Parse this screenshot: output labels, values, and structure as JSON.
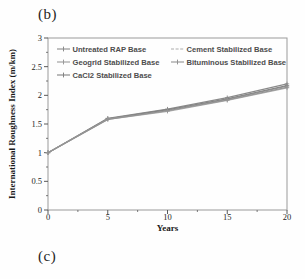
{
  "panel_labels": {
    "top": "(b)",
    "bottom": "(c)"
  },
  "chart_data": {
    "type": "line",
    "title": "",
    "xlabel": "Years",
    "ylabel": "International Roughness Index (m/km)",
    "x": [
      0,
      5,
      10,
      15,
      20
    ],
    "xlim": [
      0,
      20
    ],
    "ylim": [
      0,
      3
    ],
    "x_ticks": [
      0,
      5,
      10,
      15,
      20
    ],
    "x_minor_ticks": [
      2.5,
      7.5,
      12.5,
      17.5
    ],
    "y_ticks": [
      0,
      0.5,
      1,
      1.5,
      2,
      2.5,
      3
    ],
    "y_minor_ticks": [
      0.25,
      0.75,
      1.25,
      1.75,
      2.25,
      2.75
    ],
    "grid": false,
    "legend_position": "top-inside-two-columns",
    "series": [
      {
        "name": "Untreated RAP Base",
        "values": [
          1.0,
          1.6,
          1.76,
          1.96,
          2.2
        ],
        "color": "#8a8a8a",
        "marker": "plus",
        "legend_col": 0
      },
      {
        "name": "Geogrid Stabilized Base",
        "values": [
          1.0,
          1.59,
          1.74,
          1.93,
          2.16
        ],
        "color": "#9a9a9a",
        "marker": "plus",
        "legend_col": 0
      },
      {
        "name": "CaCl2 Stabilized Base",
        "values": [
          1.0,
          1.59,
          1.75,
          1.94,
          2.17
        ],
        "color": "#828282",
        "marker": "plus",
        "legend_col": 0
      },
      {
        "name": "Cement Stabilized Base",
        "values": [
          1.0,
          1.58,
          1.72,
          1.91,
          2.13
        ],
        "color": "#ababab",
        "marker": "dash",
        "legend_col": 1
      },
      {
        "name": "Bituminous Stabilized Base",
        "values": [
          1.0,
          1.58,
          1.73,
          1.92,
          2.14
        ],
        "color": "#929292",
        "marker": "plus",
        "legend_col": 1
      }
    ]
  },
  "colors": {
    "plot_border": "#9a9a9a",
    "axis": "#595959",
    "tick_text": "#262626",
    "axis_title_text": "#1a1a1a",
    "legend_text": "#4d4d4d",
    "background": "#fefefe"
  }
}
